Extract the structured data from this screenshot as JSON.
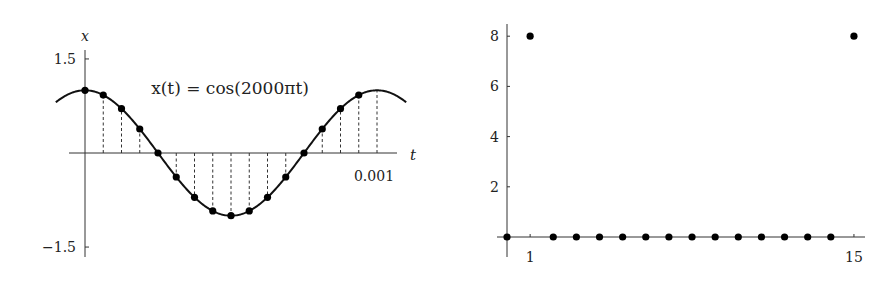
{
  "chart_data": [
    {
      "type": "line",
      "title": "x(t) = cos(2000πt)",
      "annotation": "x(t) = cos(2000πt)",
      "xlabel": "t",
      "ylabel": "x",
      "x_tick_labels": [
        "0.001"
      ],
      "x_ticks": [
        0.001
      ],
      "y_tick_labels": [
        "1.5",
        "−1.5"
      ],
      "y_ticks": [
        1.5,
        -1.5
      ],
      "xlim": [
        -0.00019,
        0.0011
      ],
      "ylim": [
        -1.65,
        1.65
      ],
      "grid": false,
      "function": "cos(2000*pi*t)",
      "frequency_hz": 1000,
      "sampling_rate_hz": 16000,
      "samples": {
        "n": [
          0,
          1,
          2,
          3,
          4,
          5,
          6,
          7,
          8,
          9,
          10,
          11,
          12,
          13,
          14,
          15
        ],
        "t": [
          0,
          6.25e-05,
          0.000125,
          0.0001875,
          0.00025,
          0.0003125,
          0.000375,
          0.0004375,
          0.0005,
          0.0005625,
          0.000625,
          0.0006875,
          0.00075,
          0.0008125,
          0.000875,
          0.0009375
        ],
        "x": [
          1,
          0.9239,
          0.7071,
          0.3827,
          0,
          -0.3827,
          -0.7071,
          -0.9239,
          -1,
          -0.9239,
          -0.7071,
          -0.3827,
          0,
          0.3827,
          0.7071,
          0.9239
        ]
      },
      "stem_lines_n": [
        1,
        2,
        3,
        5,
        6,
        7,
        8,
        9,
        10,
        11,
        13,
        14,
        15,
        16
      ]
    },
    {
      "type": "scatter",
      "title": "",
      "xlabel": "",
      "ylabel": "",
      "x": [
        0,
        1,
        2,
        3,
        4,
        5,
        6,
        7,
        8,
        9,
        10,
        11,
        12,
        13,
        14,
        15
      ],
      "values": [
        0,
        8,
        0,
        0,
        0,
        0,
        0,
        0,
        0,
        0,
        0,
        0,
        0,
        0,
        0,
        8
      ],
      "x_tick_labels": [
        "1",
        "15"
      ],
      "x_ticks": [
        1,
        15
      ],
      "y_tick_labels": [
        "2",
        "4",
        "6",
        "8"
      ],
      "y_ticks": [
        2,
        4,
        6,
        8
      ],
      "xlim": [
        -1.5,
        16.3
      ],
      "ylim": [
        -1.3,
        8.9
      ],
      "grid": false
    }
  ]
}
